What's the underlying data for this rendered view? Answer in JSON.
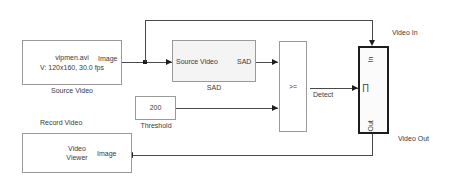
{
  "diagram": {
    "accent_color": "#1d1d1d",
    "wire_color": "#4a4a4a",
    "block_border_color": "#9a9a9a",
    "background_color": "#ffffff"
  },
  "blocks": {
    "source_video": {
      "line1": "vipmen.avi",
      "line2": "V: 120x160, 30.0 fps",
      "caption": "Source Video",
      "out_port": "Image"
    },
    "sad": {
      "in_port": "Source Video",
      "out_port": "SAD",
      "caption": "SAD"
    },
    "relational": {
      "operator": ">="
    },
    "threshold": {
      "value": "200",
      "caption": "Threshold"
    },
    "subsystem": {
      "in_port": "In",
      "out_port": "Out",
      "trigger_glyph": "∏"
    },
    "video_viewer": {
      "line1": "Video",
      "line2": "Viewer",
      "in_port": "Image",
      "caption": "Record Video"
    }
  },
  "signals": {
    "detect": "Detect",
    "video_in": "Video In",
    "video_out": "Video Out"
  }
}
